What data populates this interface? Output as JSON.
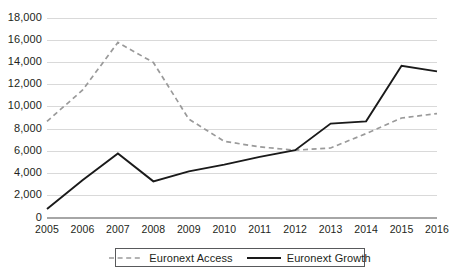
{
  "chart_data": {
    "type": "line",
    "title": "",
    "subtitle": "",
    "xlabel": "",
    "ylabel": "",
    "categories": [
      "2005",
      "2006",
      "2007",
      "2008",
      "2009",
      "2010",
      "2011",
      "2012",
      "2013",
      "2014",
      "2015",
      "2016"
    ],
    "ylim": [
      0,
      18000
    ],
    "ytick_labels": [
      "18,000",
      "16,000",
      "14,000",
      "12,000",
      "10,000",
      "8,000",
      "6,000",
      "4,000",
      "2,000",
      "0"
    ],
    "ytick_values": [
      18000,
      16000,
      14000,
      12000,
      10000,
      8000,
      6000,
      4000,
      2000,
      0
    ],
    "grid": true,
    "legend_position": "bottom",
    "series": [
      {
        "name": "Euronext Access",
        "style": "dashed",
        "color": "#9a9a9a",
        "values": [
          8700,
          11500,
          15800,
          14000,
          8900,
          6900,
          6400,
          6100,
          6300,
          7600,
          9000,
          9400
        ]
      },
      {
        "name": "Euronext Growth",
        "style": "solid",
        "color": "#1a1a1a",
        "values": [
          800,
          3400,
          5800,
          3300,
          4200,
          4800,
          5500,
          6100,
          8500,
          8700,
          13700,
          13200
        ]
      }
    ]
  },
  "legend": {
    "items": [
      {
        "label": "Euronext Access"
      },
      {
        "label": "Euronext Growth"
      }
    ]
  },
  "axes": {
    "x_axis_name": "year-axis",
    "y_axis_name": "value-axis"
  }
}
